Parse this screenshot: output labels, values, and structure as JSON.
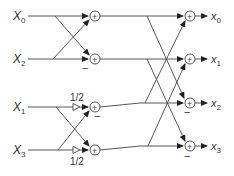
{
  "diagram": {
    "title": "",
    "inputs": [
      {
        "id": "in0",
        "label": "X",
        "subscript": "0",
        "y": 16
      },
      {
        "id": "in2",
        "label": "X",
        "subscript": "2",
        "y": 59
      },
      {
        "id": "in1",
        "label": "X",
        "subscript": "1",
        "y": 107
      },
      {
        "id": "in3",
        "label": "X",
        "subscript": "3",
        "y": 150
      }
    ],
    "outputs": [
      {
        "id": "out0",
        "label": "x",
        "subscript": "0",
        "y": 16
      },
      {
        "id": "out1",
        "label": "x",
        "subscript": "1",
        "y": 59
      },
      {
        "id": "out2",
        "label": "x",
        "subscript": "2",
        "y": 103
      },
      {
        "id": "out3",
        "label": "x",
        "subscript": "3",
        "y": 146
      }
    ],
    "adder_symbol": "+",
    "minus_symbol": "−",
    "gains": [
      {
        "row": "in1",
        "label": "1/2",
        "position": "above"
      },
      {
        "row": "in3",
        "label": "1/2",
        "position": "below"
      }
    ],
    "stage1_adders": [
      {
        "row": 0,
        "minus": false
      },
      {
        "row": 1,
        "minus": true
      },
      {
        "row": 2,
        "minus": true
      },
      {
        "row": 3,
        "minus": false
      }
    ],
    "stage2_adders": [
      {
        "row": 0,
        "minus": false
      },
      {
        "row": 1,
        "minus": false
      },
      {
        "row": 2,
        "minus": true
      },
      {
        "row": 3,
        "minus": true
      }
    ],
    "colors": {
      "stroke": "#444444",
      "background": "#ffffff",
      "text": "#333333"
    }
  }
}
